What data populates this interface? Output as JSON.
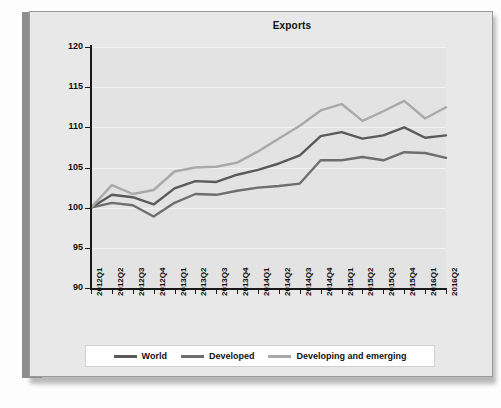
{
  "chart_data": {
    "type": "line",
    "title": "Exports",
    "xlabel": "",
    "ylabel": "",
    "ylim": [
      90,
      120
    ],
    "yticks": [
      90,
      95,
      100,
      105,
      110,
      115,
      120
    ],
    "grid": true,
    "legend_position": "bottom",
    "categories": [
      "2012Q1",
      "2012Q2",
      "2012Q3",
      "2012Q4",
      "2013Q1",
      "2013Q2",
      "2013Q3",
      "2013Q4",
      "2014Q1",
      "2014Q2",
      "2014Q3",
      "2014Q4",
      "2015Q1",
      "2015Q2",
      "2015Q3",
      "2015Q4",
      "2016Q1",
      "2016Q2"
    ],
    "series": [
      {
        "name": "World",
        "color": "#5a5a5a",
        "values": [
          100.0,
          101.6,
          101.3,
          100.4,
          102.4,
          103.3,
          103.2,
          104.1,
          104.7,
          105.5,
          106.5,
          108.9,
          109.4,
          108.6,
          109.0,
          110.0,
          108.7,
          109.0
        ]
      },
      {
        "name": "Developed",
        "color": "#6e6e6e",
        "values": [
          100.0,
          100.6,
          100.3,
          98.9,
          100.6,
          101.7,
          101.6,
          102.1,
          102.5,
          102.7,
          103.0,
          105.9,
          105.9,
          106.3,
          105.9,
          106.9,
          106.8,
          106.2
        ]
      },
      {
        "name": "Developing and emerging",
        "color": "#a9a9a9",
        "values": [
          100.0,
          102.8,
          101.7,
          102.2,
          104.5,
          105.0,
          105.1,
          105.6,
          107.0,
          108.6,
          110.2,
          112.1,
          112.9,
          110.8,
          112.0,
          113.3,
          111.1,
          112.5
        ]
      }
    ]
  },
  "legend": {
    "items": [
      {
        "label": "World"
      },
      {
        "label": "Developed"
      },
      {
        "label": "Developing and emerging"
      }
    ]
  }
}
